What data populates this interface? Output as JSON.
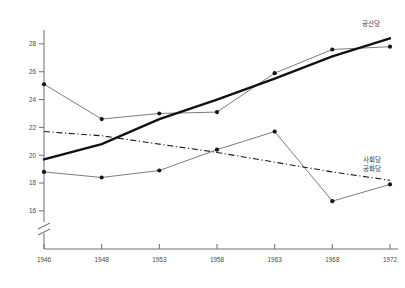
{
  "chart_data": {
    "type": "line",
    "title": "",
    "xlabel": "",
    "ylabel": "",
    "categories": [
      "1946",
      "1948",
      "1953",
      "1958",
      "1963",
      "1968",
      "1972"
    ],
    "ylim": [
      15.2,
      29.0
    ],
    "yticks": [
      16,
      18,
      20,
      22,
      24,
      26,
      28
    ],
    "ytick_labels": [
      "16",
      "18",
      "20",
      "22",
      "24",
      "26",
      "28"
    ],
    "grid": false,
    "axis_break": true,
    "legend_position": "right-inline",
    "series": [
      {
        "name": "공산당",
        "style": "marker-line",
        "values": [
          25.1,
          22.6,
          23.0,
          23.1,
          25.9,
          27.6,
          27.8
        ]
      },
      {
        "name": "사회당 공화당",
        "style": "marker-line",
        "values": [
          18.8,
          18.4,
          18.9,
          20.4,
          21.7,
          16.7,
          17.9
        ]
      },
      {
        "name": "공산당 추세선",
        "style": "solid-trend",
        "values": [
          19.7,
          20.8,
          22.6,
          24.0,
          25.5,
          27.1,
          28.4
        ]
      },
      {
        "name": "사회당 공화당 추세선",
        "style": "dashdot-trend",
        "values": [
          21.7,
          21.4,
          20.8,
          20.2,
          19.5,
          18.8,
          18.2
        ]
      }
    ],
    "annotations": [
      {
        "id": "legend-top",
        "text": "공산당",
        "x": "1972",
        "y": 29.0
      },
      {
        "id": "legend-bottom-1",
        "text": "사회당",
        "x": "1972",
        "y": 20.0
      },
      {
        "id": "legend-bottom-2",
        "text": "공화당",
        "x": "1972",
        "y": 19.3
      }
    ]
  },
  "legend": {
    "top_label": "공산당",
    "bottom_label_1": "사회당",
    "bottom_label_2": "공화당"
  }
}
